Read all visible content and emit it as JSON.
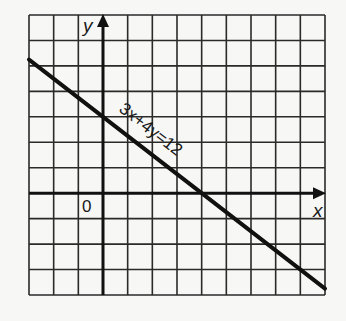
{
  "chart_data": {
    "type": "line",
    "title": "",
    "xlabel": "x",
    "ylabel": "y",
    "origin_label": "0",
    "xlim": [
      -3,
      9
    ],
    "ylim": [
      -4,
      7
    ],
    "grid": true,
    "grid_step": 1,
    "series": [
      {
        "name": "3x+4y=12",
        "equation": "3x+4y=12",
        "x": [
          -3,
          0,
          4,
          9
        ],
        "y": [
          5.25,
          3,
          0,
          -3.75
        ]
      }
    ],
    "annotations": [
      {
        "text": "3x+4y=12",
        "placement": "along line, above, near y-intercept"
      }
    ]
  },
  "layout": {
    "px_left": 29,
    "px_right": 325,
    "px_top": 15,
    "px_bottom": 295,
    "colors": {
      "grid": "#2a2a2a",
      "axis": "#111111",
      "line": "#111111",
      "background": "#f7f7f5"
    }
  }
}
